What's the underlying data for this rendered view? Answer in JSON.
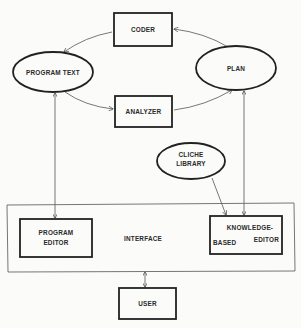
{
  "diagram": {
    "nodes": {
      "coder": {
        "label": "CODER",
        "shape": "rectangle"
      },
      "program_text": {
        "label": "PROGRAM TEXT",
        "shape": "ellipse"
      },
      "plan": {
        "label": "PLAN",
        "shape": "ellipse"
      },
      "analyzer": {
        "label": "ANALYZER",
        "shape": "rectangle"
      },
      "cliche_library": {
        "label_line1": "CLICHE",
        "label_line2": "LIBRARY",
        "shape": "ellipse"
      },
      "interface": {
        "label": "INTERFACE",
        "shape": "rectangle"
      },
      "program_editor": {
        "label_line1": "PROGRAM",
        "label_line2": "EDITOR",
        "shape": "rectangle"
      },
      "knowledge_based_editor": {
        "label_line1": "KNOWLEDGE-",
        "label_line2a": "BASED",
        "label_line2b": "EDITOR",
        "shape": "rectangle"
      },
      "user": {
        "label": "USER",
        "shape": "rectangle"
      }
    },
    "edges": [
      {
        "from": "plan",
        "to": "coder",
        "direction": "one-way"
      },
      {
        "from": "coder",
        "to": "program_text",
        "direction": "one-way"
      },
      {
        "from": "program_text",
        "to": "analyzer",
        "direction": "one-way"
      },
      {
        "from": "analyzer",
        "to": "plan",
        "direction": "one-way"
      },
      {
        "from": "program_text",
        "to": "program_editor",
        "direction": "two-way"
      },
      {
        "from": "plan",
        "to": "knowledge_based_editor",
        "direction": "two-way"
      },
      {
        "from": "cliche_library",
        "to": "knowledge_based_editor",
        "direction": "one-way"
      },
      {
        "from": "interface",
        "to": "user",
        "direction": "two-way"
      }
    ],
    "colors": {
      "ink": "#222222",
      "paper": "#fbfbf9"
    }
  }
}
